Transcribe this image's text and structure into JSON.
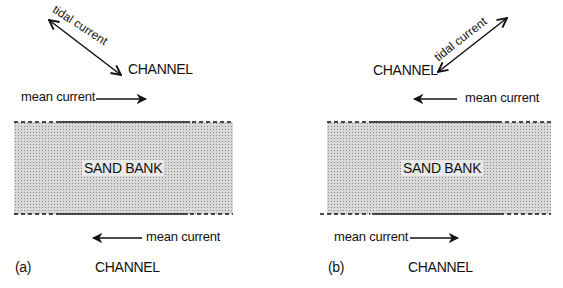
{
  "panels": [
    {
      "id": "a",
      "caption": "(a)",
      "tidal_label": "tidal current",
      "top_channel": "CHANNEL",
      "top_mean_current": "mean current",
      "top_mean_direction": "right",
      "bank_label": "SAND BANK",
      "bottom_mean_current": "mean current",
      "bottom_mean_direction": "left",
      "bottom_channel": "CHANNEL"
    },
    {
      "id": "b",
      "caption": "(b)",
      "tidal_label": "tidal current",
      "top_channel": "CHANNEL",
      "top_mean_current": "mean current",
      "top_mean_direction": "left",
      "bank_label": "SAND BANK",
      "bottom_mean_current": "mean current",
      "bottom_mean_direction": "right",
      "bottom_channel": "CHANNEL"
    }
  ],
  "colors": {
    "ink": "#111111",
    "sand_fill": "#d9d9d9",
    "sand_dots": "#8c8c8c"
  }
}
